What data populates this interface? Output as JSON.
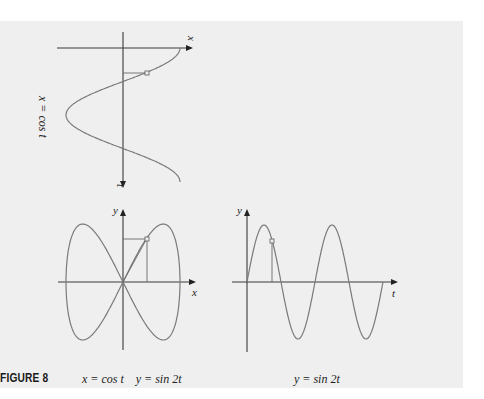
{
  "figure": {
    "number_label": "FIGURE 8",
    "caption_left": {
      "x_eq": "x = cos t",
      "y_eq": "y = sin 2t"
    },
    "caption_right": "y = sin 2t",
    "background": "#efefef",
    "curve_color": "#7a7a7a",
    "axis_color": "#3a3a3a"
  },
  "top_graph": {
    "label": "x = cos t",
    "horizontal_axis_label": "x",
    "vertical_axis_label": "t"
  },
  "bottom_left_graph": {
    "x_axis_label": "x",
    "y_axis_label": "y"
  },
  "bottom_right_graph": {
    "x_axis_label": "t",
    "y_axis_label": "y"
  },
  "chart_data": [
    {
      "type": "line",
      "title": "x = cos t (t axis pointing down)",
      "xlabel": "x",
      "ylabel": "t",
      "function": "x = cos t",
      "t_range": [
        0,
        6.283
      ],
      "highlight_point": {
        "t": 1.14,
        "x": 0.42
      },
      "grid": false
    },
    {
      "type": "line",
      "title": "Parametric curve x = cos t, y = sin 2t",
      "xlabel": "x",
      "ylabel": "y",
      "function": "x = cos t, y = sin 2t",
      "t_range": [
        0,
        6.283
      ],
      "xlim": [
        -1,
        1
      ],
      "ylim": [
        -1,
        1
      ],
      "highlight_point": {
        "x": 0.42,
        "y": 0.74
      },
      "grid": false
    },
    {
      "type": "line",
      "title": "y = sin 2t",
      "xlabel": "t",
      "ylabel": "y",
      "function": "y = sin 2t",
      "t_range": [
        0,
        6.283
      ],
      "ylim": [
        -1,
        1
      ],
      "highlight_point": {
        "t": 1.14,
        "y": 0.74
      },
      "grid": false
    }
  ]
}
